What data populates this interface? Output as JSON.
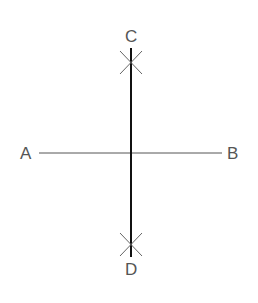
{
  "diagram": {
    "labels": {
      "a": "A",
      "b": "B",
      "c": "C",
      "d": "D"
    },
    "points": {
      "A": [
        39,
        153
      ],
      "B": [
        222,
        153
      ],
      "C": [
        131,
        48
      ],
      "D": [
        131,
        257
      ]
    },
    "colors": {
      "segment_ab": "#555555",
      "bisector_cd": "#111111",
      "arc_marks": "#666666",
      "labels": "#555555"
    }
  }
}
